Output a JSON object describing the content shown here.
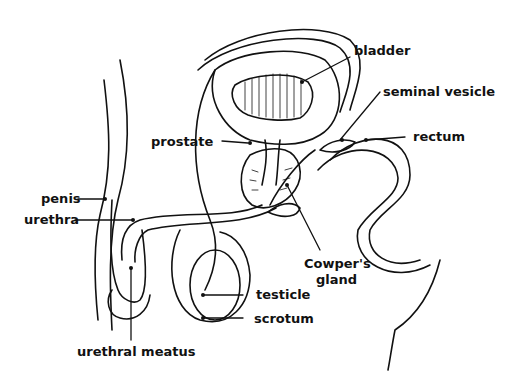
{
  "diagram": {
    "labels": {
      "bladder": "bladder",
      "seminal_vesicle": "seminal vesicle",
      "rectum": "rectum",
      "prostate": "prostate",
      "penis": "penis",
      "urethra": "urethra",
      "cowpers_gland_line1": "Cowper's",
      "cowpers_gland_line2": "gland",
      "testicle": "testicle",
      "scrotum": "scrotum",
      "urethral_meatus": "urethral meatus"
    },
    "colors": {
      "line": "#111111",
      "background": "#ffffff"
    }
  }
}
